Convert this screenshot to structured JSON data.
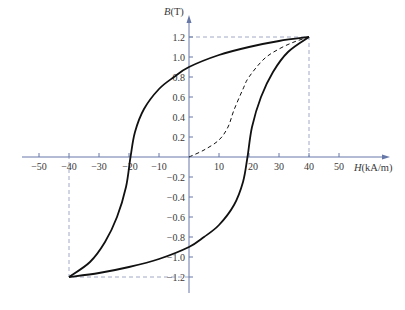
{
  "chart_data": {
    "type": "line",
    "title": "",
    "xlabel": "H(kA/m)",
    "ylabel": "B(T)",
    "xlabel_var": "H",
    "xlabel_unit": "(kA/m)",
    "ylabel_var": "B",
    "ylabel_unit": "(T)",
    "xlim": [
      -55,
      66
    ],
    "ylim": [
      -1.35,
      1.4
    ],
    "grid": false,
    "legend": null,
    "x_ticks": [
      -50,
      -40,
      -30,
      -20,
      -10,
      10,
      20,
      30,
      40,
      50
    ],
    "x_tick_labels": [
      "−50",
      "−40",
      "−30",
      "−20",
      "−10",
      "10",
      "20",
      "30",
      "40",
      "50"
    ],
    "y_ticks": [
      1.2,
      1.0,
      0.8,
      0.6,
      0.4,
      0.2,
      -0.2,
      -0.4,
      -0.6,
      -0.8,
      -1.0,
      -1.2
    ],
    "y_tick_labels": [
      "1.2",
      "1.0",
      "0.8",
      "0.6",
      "0.4",
      "0.2",
      "−0.2",
      "−0.4",
      "−0.6",
      "−0.8",
      "−1.0",
      "−1.2"
    ],
    "guides": {
      "saturation_positive": {
        "H": 40,
        "B": 1.2
      },
      "saturation_negative": {
        "H": -40,
        "B": -1.2
      }
    },
    "series": [
      {
        "name": "Hysteresis loop (descending branch)",
        "style": "solid",
        "x": [
          40,
          30,
          20,
          10,
          0,
          -5,
          -10,
          -15,
          -18,
          -19.5,
          -21,
          -24,
          -28,
          -33,
          -40
        ],
        "y": [
          1.2,
          1.16,
          1.1,
          1.02,
          0.9,
          0.8,
          0.68,
          0.48,
          0.25,
          0.0,
          -0.3,
          -0.6,
          -0.85,
          -1.05,
          -1.2
        ]
      },
      {
        "name": "Hysteresis loop (ascending branch)",
        "style": "solid",
        "x": [
          -40,
          -30,
          -20,
          -10,
          0,
          5,
          10,
          15,
          18,
          19.5,
          21,
          24,
          28,
          33,
          40
        ],
        "y": [
          -1.2,
          -1.16,
          -1.1,
          -1.02,
          -0.9,
          -0.8,
          -0.68,
          -0.48,
          -0.25,
          0.0,
          0.3,
          0.6,
          0.85,
          1.05,
          1.2
        ]
      },
      {
        "name": "Initial magnetization curve",
        "style": "dashed",
        "x": [
          0,
          5,
          10,
          13,
          15,
          18,
          20,
          25,
          30,
          35,
          40
        ],
        "y": [
          0.0,
          0.07,
          0.17,
          0.3,
          0.47,
          0.68,
          0.8,
          0.98,
          1.08,
          1.15,
          1.2
        ]
      }
    ]
  }
}
